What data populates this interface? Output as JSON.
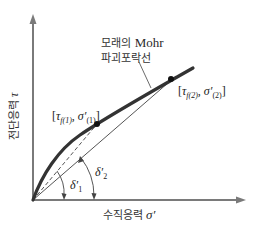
{
  "diagram": {
    "title_lines": [
      "모래의",
      "Mohr",
      "파괴포락선"
    ],
    "envelope_label": {
      "line1_korean": "모래의",
      "line1_latin": "Mohr",
      "line2": "파괴포락선"
    },
    "y_axis": {
      "label": "전단응력",
      "symbol": "τ"
    },
    "x_axis": {
      "label": "수직응력",
      "symbol": "σ′"
    },
    "points": [
      {
        "id": "1",
        "label": "[τf(1), σ′(1)]",
        "tau_sub": "f(1)",
        "sigma_sub": "(1)"
      },
      {
        "id": "2",
        "label": "[τf(2), σ′(2)]",
        "tau_sub": "f(2)",
        "sigma_sub": "(2)"
      }
    ],
    "angles": [
      {
        "id": "delta1",
        "label": "δ′1",
        "base": "δ′",
        "sub": "1"
      },
      {
        "id": "delta2",
        "label": "δ′2",
        "base": "δ′",
        "sub": "2"
      }
    ],
    "colors": {
      "axis": "#7a7a7a",
      "envelope": "#333333",
      "thin_line": "#555555",
      "text": "#2a2a2a",
      "background": "#ffffff"
    }
  }
}
